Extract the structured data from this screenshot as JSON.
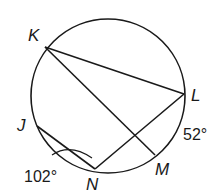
{
  "figure": {
    "points": {
      "K": {
        "label": "K",
        "x": 45,
        "y": 47
      },
      "L": {
        "label": "L",
        "x": 184,
        "y": 94
      },
      "J": {
        "label": "J",
        "x": 36,
        "y": 125
      },
      "N": {
        "label": "N",
        "x": 95,
        "y": 169
      },
      "M": {
        "label": "M",
        "x": 155,
        "y": 156
      }
    },
    "arc_labels": {
      "LM": "52°",
      "JN": "102°"
    },
    "colors": {
      "stroke": "#1a1a1a",
      "background": "#ffffff"
    }
  }
}
